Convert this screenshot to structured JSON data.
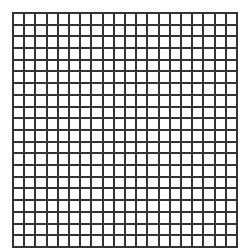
{
  "grid": {
    "rows": 20,
    "columns": 20,
    "line_color": "#333333",
    "background_color": "#ffffff"
  }
}
